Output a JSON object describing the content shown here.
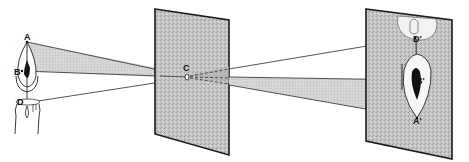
{
  "diagram": {
    "type": "pinhole-camera",
    "source_labels": {
      "A": "A",
      "B": "B",
      "D": "D"
    },
    "pinhole_label": "C",
    "image_labels": {
      "A": "A'",
      "B": "B'",
      "D": "D'"
    },
    "colors": {
      "panel_fill": "#bdbdbd",
      "panel_border": "#1a1a1a",
      "ray_fill": "#d4d4d4",
      "line": "#2a2a2a",
      "background": "#ffffff"
    }
  }
}
